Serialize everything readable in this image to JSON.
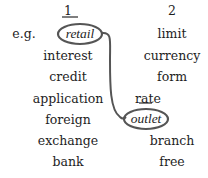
{
  "exercise": {
    "example_label": "e.g.",
    "columns": [
      {
        "header": "1",
        "words": [
          "retail",
          "interest",
          "credit",
          "application",
          "foreign",
          "exchange",
          "bank"
        ]
      },
      {
        "header": "2",
        "words": [
          "limit",
          "currency",
          "form",
          "rate",
          "outlet",
          "branch",
          "free"
        ]
      }
    ],
    "example_match": {
      "from": "retail",
      "to": "outlet"
    },
    "colors": {
      "ink": "#1e1e1e",
      "circle_stroke": "#555555"
    }
  }
}
